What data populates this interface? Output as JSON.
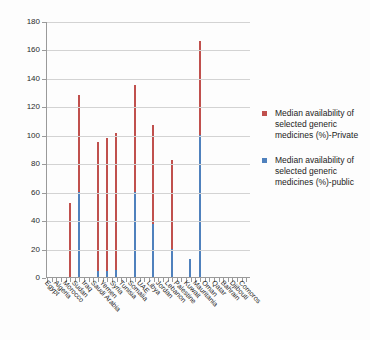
{
  "chart_data": {
    "type": "bar",
    "title": "",
    "xlabel": "",
    "ylabel": "",
    "ylim": [
      0,
      180
    ],
    "ytick_step": 20,
    "yticks": [
      0,
      20,
      40,
      60,
      80,
      100,
      120,
      140,
      160,
      180
    ],
    "grid": true,
    "legend_position": "right",
    "categories": [
      "Egypt",
      "Algeria",
      "Morocco",
      "Sudan",
      "Iraq",
      "Saudi Arabia",
      "Yemen",
      "Syria",
      "Tunisia",
      "Somalia",
      "UAE",
      "Libya",
      "Jordan",
      "Lebanon",
      "Palestine",
      "Kuwait",
      "Mauritania",
      "Oman",
      "Qatar",
      "Bahrain",
      "Djibouti",
      "Comoros"
    ],
    "series": [
      {
        "name": "Median availability of selected generic medicines (%)-Private",
        "color": "#c0504d",
        "values": [
          0,
          0,
          52,
          128,
          0,
          95,
          98,
          101,
          0,
          135,
          0,
          107,
          0,
          82,
          0,
          0,
          166,
          0,
          0,
          0,
          0,
          0
        ]
      },
      {
        "name": "Median availability of selected generic medicines (%)-public",
        "color": "#4f81bd",
        "values": [
          0,
          0,
          0,
          60,
          0,
          4,
          4,
          5,
          0,
          60,
          0,
          37,
          0,
          20,
          0,
          13,
          100,
          0,
          0,
          0,
          0,
          0
        ]
      }
    ]
  },
  "legend": {
    "items": [
      {
        "swatch": "private-swatch",
        "label": "Median availability of selected generic medicines (%)-Private"
      },
      {
        "swatch": "public-swatch",
        "label": "Median availability of selected generic medicines (%)-public"
      }
    ]
  }
}
